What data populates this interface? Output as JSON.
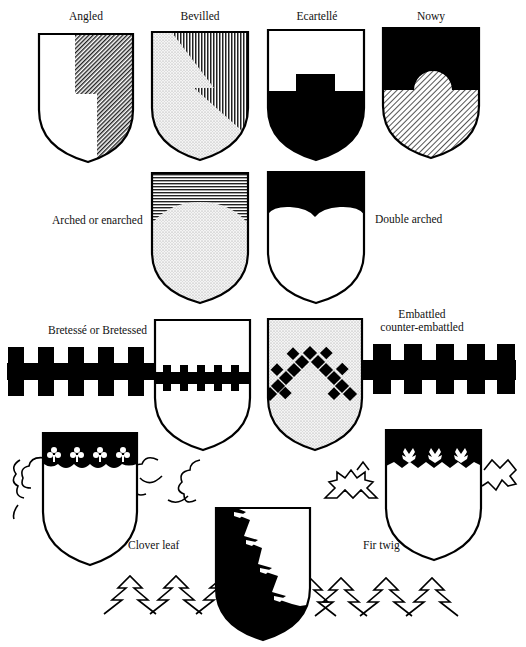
{
  "figure": {
    "labels": {
      "angled": "Angled",
      "bevilled": "Bevilled",
      "ecartelle": "Ecartellé",
      "nowy": "Nowy",
      "arched": "Arched or enarched",
      "double_arched": "Double arched",
      "bretesse": "Bretessé or Bretessed",
      "embattled_1": "Embattled",
      "embattled_2": "counter-embattled",
      "clover_leaf": "Clover leaf",
      "fir_twig": "Fir twig"
    },
    "colors": {
      "ink": "#000000",
      "paper": "#ffffff",
      "stipple": "#d9d9d9"
    }
  }
}
